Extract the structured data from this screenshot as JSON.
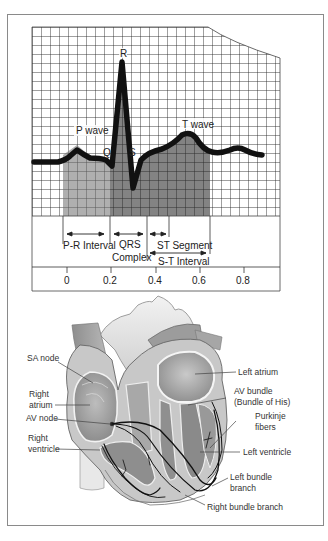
{
  "ecg": {
    "wave_labels": {
      "p": "P wave",
      "q": "Q",
      "r": "R",
      "s": "S",
      "t": "T wave"
    },
    "interval_labels": {
      "pr": "P-R Interval",
      "qrs_line1": "QRS",
      "qrs_line2": "Complex",
      "st_segment": "ST Segment",
      "st_interval": "S-T Interval"
    },
    "axis_ticks": [
      "0",
      "0.2",
      "0.4",
      "0.6",
      "0.8"
    ]
  },
  "heart": {
    "labels": {
      "sa_node": "SA node",
      "right_atrium_1": "Right",
      "right_atrium_2": "atrium",
      "av_node": "AV node",
      "right_ventricle_1": "Right",
      "right_ventricle_2": "ventricle",
      "left_atrium": "Left atrium",
      "av_bundle_1": "AV bundle",
      "av_bundle_2": "(Bundle of His)",
      "purkinje_1": "Purkinje",
      "purkinje_2": "fibers",
      "left_ventricle": "Left ventricle",
      "left_bundle_1": "Left bundle",
      "left_bundle_2": "branch",
      "right_bundle": "Right bundle branch"
    }
  },
  "colors": {
    "grid": "#2a2a2a",
    "pr_shade": "#6e6e6e",
    "qrs_shade": "#262626",
    "trace": "#111111",
    "heart_light": "#d4d4d4",
    "heart_mid": "#9a9a9a",
    "heart_dark": "#7a7a7a"
  }
}
